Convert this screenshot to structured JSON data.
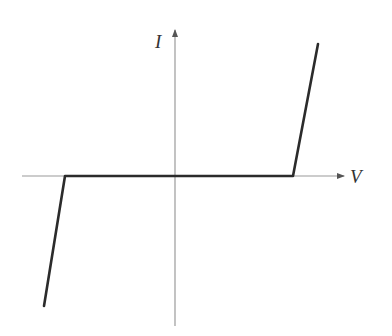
{
  "diagram": {
    "title": "",
    "type": "I-V characteristic curve",
    "axes": {
      "x_label": "V",
      "y_label": "I"
    },
    "colors": {
      "axis": "#9a9a9a",
      "curve": "#2b2b2b",
      "label": "#333333",
      "background": "#ffffff"
    },
    "geometry": {
      "origin": [
        175,
        176
      ],
      "x_axis": {
        "from": [
          22,
          176
        ],
        "to": [
          346,
          176
        ]
      },
      "y_axis": {
        "from": [
          175,
          326
        ],
        "to": [
          175,
          28
        ]
      },
      "curve_points": [
        [
          44,
          306
        ],
        [
          65,
          176
        ],
        [
          293,
          176
        ],
        [
          318,
          44
        ]
      ]
    }
  }
}
